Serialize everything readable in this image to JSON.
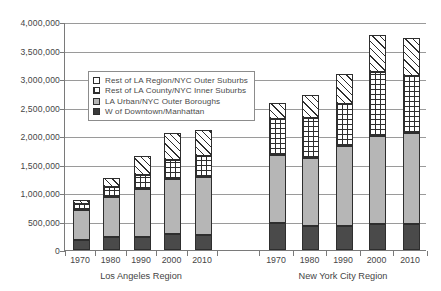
{
  "chart_data": {
    "type": "bar",
    "subtype": "stacked-bar",
    "title": "",
    "xlabel": "",
    "ylabel": "",
    "ylim": [
      0,
      4000000
    ],
    "ytick_values": [
      0,
      500000,
      1000000,
      1500000,
      2000000,
      2500000,
      3000000,
      3500000,
      4000000
    ],
    "ytick_labels": [
      "0",
      "500,000",
      "1,000,000",
      "1,500,000",
      "2,000,000",
      "2,500,000",
      "3,000,000",
      "3,500,000",
      "4,000,000"
    ],
    "grid": true,
    "grid_axis": "y",
    "legend_position": "upper-left-inside",
    "groups": [
      {
        "name": "Los Angeles Region",
        "categories": [
          "1970",
          "1980",
          "1990",
          "2000",
          "2010"
        ]
      },
      {
        "name": "New York City Region",
        "categories": [
          "1970",
          "1980",
          "1990",
          "2000",
          "2010"
        ]
      }
    ],
    "categories": [
      "1970",
      "1980",
      "1990",
      "2000",
      "2010",
      "1970",
      "1980",
      "1990",
      "2000",
      "2010"
    ],
    "series": [
      {
        "name": "W of Downtown/Manhattan",
        "swatch": "solid-black",
        "color": "#4a4a4a",
        "values": [
          180000,
          220000,
          225000,
          275000,
          260000,
          480000,
          420000,
          430000,
          455000,
          465000
        ]
      },
      {
        "name": "LA Urban/NYC Outer Boroughs",
        "swatch": "solid-gray",
        "color": "#b6b6b6",
        "values": [
          530000,
          710000,
          850000,
          965000,
          1015000,
          1180000,
          1200000,
          1400000,
          1540000,
          1585000
        ]
      },
      {
        "name": "Rest of LA County/NYC Inner Suburbs",
        "swatch": "crosshatch",
        "color": "#ffffff",
        "values": [
          105000,
          175000,
          235000,
          335000,
          375000,
          635000,
          690000,
          740000,
          1120000,
          1010000
        ]
      },
      {
        "name": "Rest of LA Region/NYC Outer Suburbs",
        "swatch": "diagonal-hatch",
        "color": "#ffffff",
        "values": [
          60000,
          155000,
          340000,
          485000,
          455000,
          280000,
          405000,
          515000,
          655000,
          665000
        ]
      }
    ],
    "totals": [
      875000,
      1260000,
      1650000,
      2060000,
      2105000,
      2575000,
      2715000,
      3085000,
      3770000,
      3725000
    ]
  },
  "legend": {
    "items": [
      {
        "label": "Rest of LA Region/NYC Outer Suburbs",
        "swatch": "k0"
      },
      {
        "label": "Rest of LA County/NYC Inner Suburbs",
        "swatch": "k1"
      },
      {
        "label": "LA Urban/NYC Outer Boroughs",
        "swatch": "k2"
      },
      {
        "label": "W of Downtown/Manhattan",
        "swatch": "k3"
      }
    ]
  }
}
